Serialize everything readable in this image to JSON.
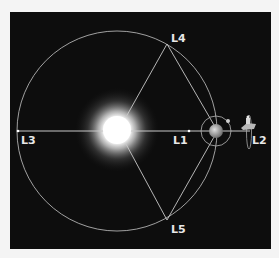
{
  "diagram": {
    "labels": {
      "l1": "L1",
      "l2": "L2",
      "l3": "L3",
      "l4": "L4",
      "l5": "L5"
    },
    "objects": [
      "sun",
      "earth",
      "moon",
      "satellite"
    ],
    "colors": {
      "background": "#0d0d0d",
      "lines": "#c8c8c8",
      "labels": "#e8e8e8",
      "sun_core": "#ffffff"
    }
  }
}
